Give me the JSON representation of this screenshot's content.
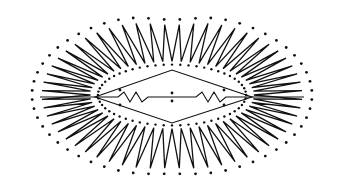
{
  "figure": {
    "description": "Lip-shaped stitching pattern: outer zigzag satin-stitch fringe with dotted guide points, inner diamond outline with two small zigzag segments and center dots",
    "colors": {
      "ink": "#111111",
      "background": "#ffffff"
    },
    "center": [
      172,
      95
    ],
    "outer_ellipse": {
      "rx": 140,
      "ry": 82
    },
    "inner_ellipse": {
      "rx": 78,
      "ry": 32
    },
    "zigzag_teeth": 56,
    "diamond": {
      "left": [
        95,
        97
      ],
      "top": [
        172,
        70
      ],
      "right": [
        252,
        97
      ],
      "bottom": [
        172,
        123
      ]
    }
  }
}
